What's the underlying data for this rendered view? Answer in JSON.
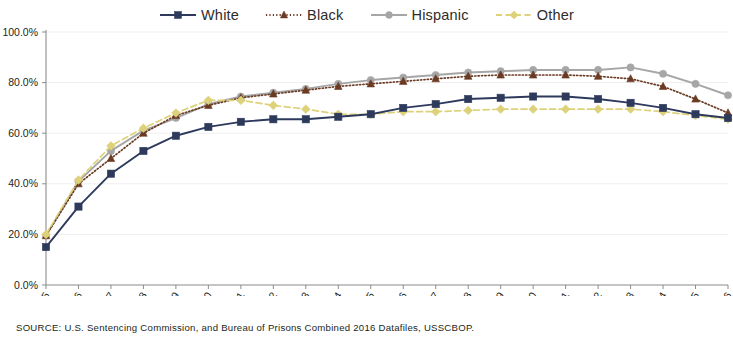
{
  "legend": {
    "position": "top-center",
    "entries": [
      {
        "label": "White",
        "color": "#2e3a5c",
        "marker": "square",
        "line": "solid"
      },
      {
        "label": "Black",
        "color": "#6b3a23",
        "marker": "triangle",
        "line": "dotted"
      },
      {
        "label": "Hispanic",
        "color": "#a6a6a6",
        "marker": "circle",
        "line": "solid"
      },
      {
        "label": "Other",
        "color": "#ddd27a",
        "marker": "diamond",
        "line": "dashed"
      }
    ]
  },
  "axes": {
    "y_ticks": [
      "0.0%",
      "20.0%",
      "40.0%",
      "60.0%",
      "80.0%",
      "100.0%"
    ],
    "x_ticks": [
      "1995",
      "1996",
      "1997",
      "1998",
      "1999",
      "2000",
      "2001",
      "2002",
      "2003",
      "2004",
      "2005",
      "2006",
      "2007",
      "2008",
      "2009",
      "2010",
      "2011",
      "2012",
      "2013",
      "2014",
      "2015",
      "2016"
    ]
  },
  "source": {
    "text": "SOURCE:  U.S. Sentencing Commission, and Bureau of Prisons Combined 2016 Datafiles, USSCBOP."
  },
  "chart_data": {
    "type": "line",
    "title": "",
    "xlabel": "",
    "ylabel": "",
    "ylim": [
      0,
      100
    ],
    "ytick_values": [
      0,
      20,
      40,
      60,
      80,
      100
    ],
    "grid": true,
    "legend_position": "top-center",
    "x": [
      1995,
      1996,
      1997,
      1998,
      1999,
      2000,
      2001,
      2002,
      2003,
      2004,
      2005,
      2006,
      2007,
      2008,
      2009,
      2010,
      2011,
      2012,
      2013,
      2014,
      2015,
      2016
    ],
    "categories": [
      "1995",
      "1996",
      "1997",
      "1998",
      "1999",
      "2000",
      "2001",
      "2002",
      "2003",
      "2004",
      "2005",
      "2006",
      "2007",
      "2008",
      "2009",
      "2010",
      "2011",
      "2012",
      "2013",
      "2014",
      "2015",
      "2016"
    ],
    "series": [
      {
        "name": "White",
        "color": "#2e3a5c",
        "marker": "square",
        "line": "solid",
        "values": [
          15.0,
          31.0,
          44.0,
          53.0,
          59.0,
          62.5,
          64.5,
          65.5,
          65.5,
          66.5,
          67.5,
          70.0,
          71.5,
          73.5,
          74.0,
          74.5,
          74.5,
          73.5,
          72.0,
          70.0,
          67.5,
          66.0
        ]
      },
      {
        "name": "Black",
        "color": "#6b3a23",
        "marker": "triangle",
        "line": "dotted",
        "values": [
          19.5,
          40.0,
          50.0,
          60.0,
          67.0,
          71.0,
          74.0,
          75.5,
          77.0,
          78.5,
          79.5,
          80.5,
          81.5,
          82.5,
          83.0,
          83.0,
          83.0,
          82.5,
          81.5,
          78.5,
          73.5,
          68.0
        ]
      },
      {
        "name": "Hispanic",
        "color": "#a6a6a6",
        "marker": "circle",
        "line": "solid",
        "values": [
          19.5,
          41.0,
          53.0,
          61.0,
          66.0,
          71.5,
          74.5,
          76.0,
          77.5,
          79.5,
          81.0,
          82.0,
          83.0,
          84.0,
          84.5,
          85.0,
          85.0,
          85.0,
          86.0,
          83.5,
          79.5,
          75.0
        ]
      },
      {
        "name": "Other",
        "color": "#ddd27a",
        "marker": "diamond",
        "line": "dashed",
        "values": [
          20.0,
          41.5,
          55.0,
          62.0,
          68.0,
          73.0,
          73.0,
          71.0,
          69.5,
          67.5,
          67.5,
          68.5,
          68.5,
          69.0,
          69.5,
          69.5,
          69.5,
          69.5,
          69.5,
          68.5,
          67.0,
          65.5
        ]
      }
    ]
  }
}
